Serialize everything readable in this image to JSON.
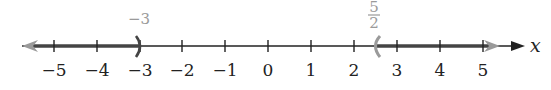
{
  "number_line": {
    "variable": "x",
    "ticks": [
      "−5",
      "−4",
      "−3",
      "−2",
      "−1",
      "0",
      "1",
      "2",
      "3",
      "4",
      "5"
    ],
    "tick_values": [
      -5,
      -4,
      -3,
      -2,
      -1,
      0,
      1,
      2,
      3,
      4,
      5
    ],
    "intervals": [
      {
        "from": "-infinity",
        "to": -3,
        "to_type": "open",
        "to_label": "−3"
      },
      {
        "from": 2.5,
        "from_type": "open",
        "from_label_num": "5",
        "from_label_den": "2",
        "to": "infinity"
      }
    ],
    "colors": {
      "axis": "#222222",
      "shading": "#555555",
      "endpoint": "#9a9a9a",
      "arrow_shade": "#9a9a9a"
    }
  }
}
